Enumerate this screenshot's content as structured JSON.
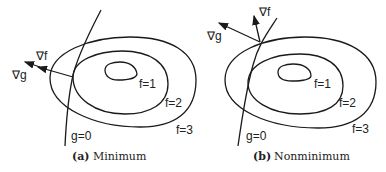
{
  "panels": [
    {
      "id": "a",
      "caption_letter": "(a)",
      "caption_text": "Minimum",
      "labels": {
        "grad_f": "∇f",
        "grad_g": "∇g",
        "f1": "f=1",
        "f2": "f=2",
        "f3": "f=3",
        "constraint": "g=0"
      }
    },
    {
      "id": "b",
      "caption_letter": "(b)",
      "caption_text": "Nonminimum",
      "labels": {
        "grad_f": "∇f",
        "grad_g": "∇g",
        "f1": "f=1",
        "f2": "f=2",
        "f3": "f=3",
        "constraint": "g=0"
      }
    }
  ]
}
